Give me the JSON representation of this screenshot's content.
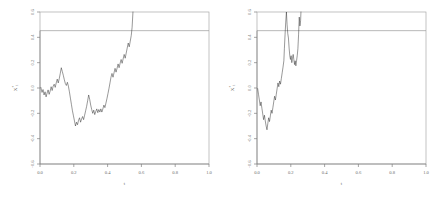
{
  "figure": {
    "panel_count": 2,
    "background": "#ffffff",
    "path_color": "#1a1a1a",
    "axis_color": "#808080",
    "barrier_color": "#9a9a9a"
  },
  "chart_data": [
    {
      "type": "line",
      "title": "",
      "xlabel": "t",
      "ylabel": "X*t",
      "xlim": [
        0.0,
        1.0
      ],
      "ylim": [
        -0.6,
        0.6
      ],
      "xticks": [
        0.0,
        0.2,
        0.4,
        0.6,
        0.8,
        1.0
      ],
      "xticklabels": [
        "0.0",
        "0.2",
        "0.4",
        "0.6",
        "0.8",
        "1.0"
      ],
      "yticks": [
        -0.6,
        -0.4,
        -0.2,
        0.0,
        0.2,
        0.4,
        0.6
      ],
      "yticklabels": [
        "-0.6",
        "-0.4",
        "-0.2",
        "0.0",
        "0.2",
        "0.4",
        "0.6"
      ],
      "grid": false,
      "legend": "none",
      "annotations": [
        {
          "kind": "horizontal-barrier",
          "y": 0.6,
          "label": ""
        }
      ],
      "series": [
        {
          "name": "sample-path-1",
          "stopped_at_barrier": true,
          "hit_time": 0.55,
          "x": [
            0.005,
            0.012,
            0.018,
            0.024,
            0.03,
            0.036,
            0.042,
            0.048,
            0.054,
            0.06,
            0.066,
            0.072,
            0.078,
            0.084,
            0.09,
            0.096,
            0.102,
            0.108,
            0.114,
            0.12,
            0.126,
            0.132,
            0.138,
            0.144,
            0.15,
            0.156,
            0.162,
            0.168,
            0.174,
            0.18,
            0.186,
            0.192,
            0.198,
            0.204,
            0.21,
            0.216,
            0.222,
            0.228,
            0.234,
            0.24,
            0.246,
            0.252,
            0.258,
            0.264,
            0.27,
            0.276,
            0.282,
            0.288,
            0.294,
            0.3,
            0.306,
            0.312,
            0.318,
            0.324,
            0.33,
            0.336,
            0.342,
            0.348,
            0.354,
            0.36,
            0.366,
            0.372,
            0.378,
            0.384,
            0.39,
            0.396,
            0.402,
            0.408,
            0.414,
            0.42,
            0.426,
            0.432,
            0.438,
            0.444,
            0.45,
            0.456,
            0.462,
            0.468,
            0.474,
            0.48,
            0.486,
            0.492,
            0.498,
            0.504,
            0.51,
            0.516,
            0.522,
            0.528,
            0.534,
            0.54,
            0.545,
            0.55
          ],
          "y": [
            0.005,
            -0.035,
            -0.012,
            -0.055,
            -0.03,
            -0.07,
            -0.04,
            -0.015,
            -0.05,
            -0.025,
            0.01,
            -0.02,
            0.015,
            0.03,
            0.005,
            0.04,
            0.07,
            0.04,
            0.075,
            0.115,
            0.16,
            0.13,
            0.1,
            0.065,
            0.035,
            0.02,
            0.045,
            0.015,
            -0.03,
            -0.08,
            -0.13,
            -0.18,
            -0.22,
            -0.26,
            -0.3,
            -0.27,
            -0.29,
            -0.255,
            -0.235,
            -0.27,
            -0.245,
            -0.225,
            -0.25,
            -0.215,
            -0.18,
            -0.145,
            -0.1,
            -0.055,
            -0.09,
            -0.135,
            -0.17,
            -0.2,
            -0.175,
            -0.21,
            -0.185,
            -0.165,
            -0.195,
            -0.17,
            -0.19,
            -0.165,
            -0.19,
            -0.165,
            -0.135,
            -0.155,
            -0.12,
            -0.085,
            -0.045,
            -0.005,
            0.04,
            0.085,
            0.115,
            0.085,
            0.12,
            0.155,
            0.125,
            0.155,
            0.19,
            0.16,
            0.195,
            0.225,
            0.195,
            0.23,
            0.265,
            0.235,
            0.275,
            0.315,
            0.355,
            0.325,
            0.37,
            0.415,
            0.48,
            0.6
          ]
        }
      ]
    },
    {
      "type": "line",
      "title": "",
      "xlabel": "t",
      "ylabel": "X*t",
      "xlim": [
        0.0,
        1.0
      ],
      "ylim": [
        -0.6,
        0.6
      ],
      "xticks": [
        0.0,
        0.2,
        0.4,
        0.6,
        0.8,
        1.0
      ],
      "xticklabels": [
        "0.0",
        "0.2",
        "0.4",
        "0.6",
        "0.8",
        "1.0"
      ],
      "yticks": [
        -0.6,
        -0.4,
        -0.2,
        0.0,
        0.2,
        0.4,
        0.6
      ],
      "yticklabels": [
        "-0.6",
        "-0.4",
        "-0.2",
        "0.0",
        "0.2",
        "0.4",
        "0.6"
      ],
      "grid": false,
      "legend": "none",
      "annotations": [
        {
          "kind": "horizontal-barrier",
          "y": 0.6,
          "label": ""
        }
      ],
      "series": [
        {
          "name": "sample-path-2",
          "stopped_at_barrier": true,
          "hit_time": 0.26,
          "x": [
            0.004,
            0.009,
            0.014,
            0.019,
            0.024,
            0.029,
            0.034,
            0.039,
            0.044,
            0.049,
            0.054,
            0.059,
            0.064,
            0.069,
            0.074,
            0.079,
            0.084,
            0.089,
            0.094,
            0.099,
            0.104,
            0.109,
            0.114,
            0.119,
            0.124,
            0.129,
            0.134,
            0.139,
            0.144,
            0.149,
            0.154,
            0.159,
            0.162,
            0.166,
            0.17,
            0.174,
            0.178,
            0.182,
            0.186,
            0.19,
            0.194,
            0.198,
            0.202,
            0.206,
            0.21,
            0.214,
            0.218,
            0.222,
            0.226,
            0.23,
            0.234,
            0.238,
            0.242,
            0.246,
            0.25,
            0.254,
            0.258,
            0.26
          ],
          "y": [
            -0.005,
            -0.05,
            -0.095,
            -0.14,
            -0.11,
            -0.16,
            -0.205,
            -0.25,
            -0.215,
            -0.26,
            -0.3,
            -0.33,
            -0.28,
            -0.235,
            -0.265,
            -0.22,
            -0.175,
            -0.2,
            -0.155,
            -0.11,
            -0.065,
            -0.095,
            -0.05,
            -0.005,
            0.04,
            0.01,
            0.055,
            0.03,
            0.075,
            0.12,
            0.165,
            0.215,
            0.31,
            0.42,
            0.52,
            0.6,
            0.5,
            0.43,
            0.395,
            0.315,
            0.255,
            0.225,
            0.255,
            0.2,
            0.235,
            0.265,
            0.225,
            0.185,
            0.215,
            0.175,
            0.215,
            0.255,
            0.31,
            0.42,
            0.56,
            0.49,
            0.53,
            0.6
          ]
        }
      ]
    }
  ]
}
